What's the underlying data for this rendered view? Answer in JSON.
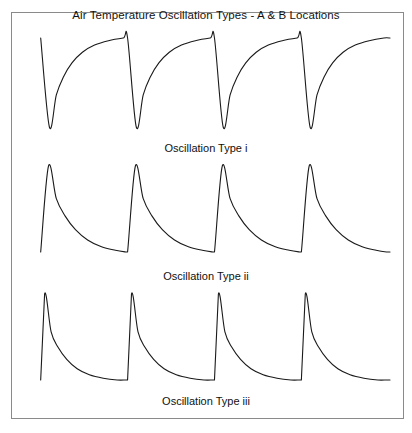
{
  "figure": {
    "title": "Air Temperature Oscillation Types - A & B Locations",
    "background_color": "#ffffff",
    "border_color": "#8a8a8a",
    "curve_color": "#1a1a1a"
  },
  "panels": [
    {
      "caption": "Oscillation Type i"
    },
    {
      "caption": "Oscillation Type ii"
    },
    {
      "caption": "Oscillation Type iii"
    }
  ],
  "chart_data": [
    {
      "type": "line",
      "title": "Oscillation Type i",
      "subtitle": "",
      "xlabel": "",
      "ylabel": "",
      "grid": false,
      "legend": "none",
      "xlim": [
        0,
        4.12
      ],
      "ylim": [
        0,
        1
      ],
      "waveform": "inverted-sawtooth-sharp-drop-concave-recovery",
      "cycles": 4,
      "period": 1.0,
      "phase_start": 0.1,
      "plateau_level": 1.0,
      "minimum_level": 0.0,
      "drop_width": 0.1,
      "recovery_exponent": 3.2,
      "series": [
        {
          "name": "Air temperature (Type i)",
          "x": [
            0.1,
            0.2,
            0.28,
            0.36,
            0.46,
            0.58,
            0.72,
            0.88,
            1.05,
            1.1,
            1.2,
            1.28,
            1.36,
            1.46,
            1.58,
            1.72,
            1.88,
            2.05,
            2.1,
            2.2,
            2.28,
            2.36,
            2.46,
            2.58,
            2.72,
            2.88,
            3.05,
            3.1,
            3.2,
            3.28,
            3.36,
            3.46,
            3.58,
            3.72,
            3.88,
            4.05,
            4.12
          ],
          "y": [
            1.0,
            0.0,
            0.36,
            0.56,
            0.72,
            0.84,
            0.92,
            0.97,
            1.0,
            1.0,
            0.0,
            0.36,
            0.56,
            0.72,
            0.84,
            0.92,
            0.97,
            1.0,
            1.0,
            0.0,
            0.36,
            0.56,
            0.72,
            0.84,
            0.92,
            0.97,
            1.0,
            1.0,
            0.0,
            0.36,
            0.56,
            0.72,
            0.84,
            0.92,
            0.97,
            1.0,
            1.0
          ]
        }
      ]
    },
    {
      "type": "line",
      "title": "Oscillation Type ii",
      "subtitle": "",
      "xlabel": "",
      "ylabel": "",
      "grid": false,
      "legend": "none",
      "xlim": [
        0,
        4.12
      ],
      "ylim": [
        0,
        1
      ],
      "waveform": "sawtooth-sharp-rise-convex-decay",
      "cycles": 4,
      "period": 1.0,
      "phase_start": 0.1,
      "peak_level": 1.0,
      "baseline_level": 0.0,
      "rise_width": 0.09,
      "decay_exponent": 2.6,
      "series": [
        {
          "name": "Air temperature (Type ii)",
          "x": [
            0.1,
            0.19,
            0.28,
            0.38,
            0.5,
            0.64,
            0.8,
            0.96,
            1.08,
            1.1,
            1.19,
            1.28,
            1.38,
            1.5,
            1.64,
            1.8,
            1.96,
            2.08,
            2.1,
            2.19,
            2.28,
            2.38,
            2.5,
            2.64,
            2.8,
            2.96,
            3.08,
            3.1,
            3.19,
            3.28,
            3.38,
            3.5,
            3.64,
            3.8,
            3.96,
            4.08,
            4.12
          ],
          "y": [
            0.0,
            1.0,
            0.62,
            0.42,
            0.26,
            0.14,
            0.06,
            0.02,
            0.0,
            0.0,
            1.0,
            0.62,
            0.42,
            0.26,
            0.14,
            0.06,
            0.02,
            0.0,
            0.0,
            1.0,
            0.62,
            0.42,
            0.26,
            0.14,
            0.06,
            0.02,
            0.0,
            0.0,
            1.0,
            0.62,
            0.42,
            0.26,
            0.14,
            0.06,
            0.02,
            0.0,
            0.0
          ]
        }
      ]
    },
    {
      "type": "line",
      "title": "Oscillation Type iii",
      "subtitle": "",
      "xlabel": "",
      "ylabel": "",
      "grid": false,
      "legend": "none",
      "xlim": [
        0,
        4.12
      ],
      "ylim": [
        0,
        1
      ],
      "waveform": "sawtooth-vertical-rise-fast-convex-decay",
      "cycles": 4,
      "period": 1.0,
      "phase_start": 0.1,
      "peak_level": 1.0,
      "baseline_level": 0.0,
      "rise_width": 0.045,
      "decay_exponent": 3.4,
      "series": [
        {
          "name": "Air temperature (Type iii)",
          "x": [
            0.1,
            0.145,
            0.22,
            0.3,
            0.4,
            0.52,
            0.66,
            0.82,
            0.98,
            1.08,
            1.1,
            1.145,
            1.22,
            1.3,
            1.4,
            1.52,
            1.66,
            1.82,
            1.98,
            2.08,
            2.1,
            2.145,
            2.22,
            2.3,
            2.4,
            2.52,
            2.66,
            2.82,
            2.98,
            3.08,
            3.1,
            3.145,
            3.22,
            3.3,
            3.4,
            3.52,
            3.66,
            3.82,
            3.98,
            4.08,
            4.12
          ],
          "y": [
            0.0,
            1.0,
            0.56,
            0.38,
            0.24,
            0.13,
            0.06,
            0.02,
            0.0,
            0.0,
            0.0,
            1.0,
            0.56,
            0.38,
            0.24,
            0.13,
            0.06,
            0.02,
            0.0,
            0.0,
            0.0,
            1.0,
            0.56,
            0.38,
            0.24,
            0.13,
            0.06,
            0.02,
            0.0,
            0.0,
            0.0,
            1.0,
            0.56,
            0.38,
            0.24,
            0.13,
            0.06,
            0.02,
            0.0,
            0.0,
            0.0
          ]
        }
      ]
    }
  ]
}
